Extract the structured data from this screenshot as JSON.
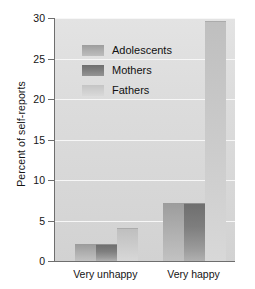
{
  "chart_data": {
    "type": "bar",
    "title": "",
    "subtitle": "",
    "xlabel": "",
    "ylabel": "Percent of self-reports",
    "categories": [
      "Very unhappy",
      "Very happy"
    ],
    "series": [
      {
        "name": "Adolescents",
        "values": [
          2,
          7
        ],
        "color": "#a8a8a8"
      },
      {
        "name": "Mothers",
        "values": [
          2,
          7
        ],
        "color": "#7a7a7a"
      },
      {
        "name": "Fathers",
        "values": [
          4,
          29.5
        ],
        "color": "#cccccc"
      }
    ],
    "ylim": [
      0,
      30
    ],
    "yticks": [
      0,
      5,
      10,
      15,
      20,
      25,
      30
    ],
    "ytick_labels": [
      "0",
      "5",
      "10",
      "15",
      "20",
      "25",
      "30"
    ],
    "grid": true,
    "grid_axis": "y",
    "grid_color": "#f7f7f7",
    "legend_position": "upper-left-inside",
    "plot_background": "#dcdcdc",
    "figure_background": "#ffffff",
    "axis_color": "#6e6e6e"
  },
  "legend": {
    "items": [
      {
        "label": "Adolescents",
        "swatch": "adolescents"
      },
      {
        "label": "Mothers",
        "swatch": "mothers"
      },
      {
        "label": "Fathers",
        "swatch": "fathers"
      }
    ]
  }
}
